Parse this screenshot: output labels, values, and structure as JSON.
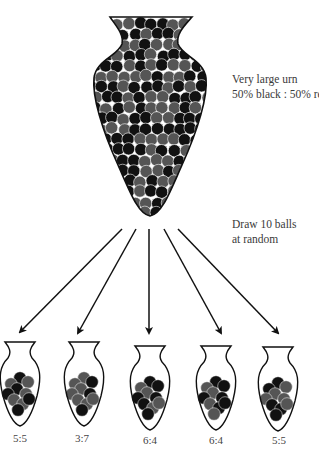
{
  "diagram": {
    "source_urn": {
      "label_line1": "Very large urn",
      "label_line2": "50% black : 50% red",
      "composition": {
        "black_percent": 50,
        "red_percent": 50
      }
    },
    "draw": {
      "label_line1": "Draw 10 balls",
      "label_line2": "at random",
      "balls_per_sample": 10
    },
    "samples": [
      {
        "ratio": "5:5",
        "black": 5,
        "red": 5
      },
      {
        "ratio": "3:7",
        "black": 3,
        "red": 7
      },
      {
        "ratio": "6:4",
        "black": 6,
        "red": 4
      },
      {
        "ratio": "6:4",
        "black": 6,
        "red": 4
      },
      {
        "ratio": "5:5",
        "black": 5,
        "red": 5
      }
    ],
    "colors": {
      "black_ball": "#111111",
      "red_ball": "#555555",
      "outline": "#111111",
      "background": "#ffffff"
    }
  }
}
